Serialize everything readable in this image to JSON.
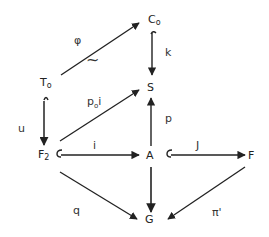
{
  "diagram": {
    "type": "commutative-diagram",
    "nodes": {
      "C0": {
        "base": "C",
        "sub": "o"
      },
      "T0": {
        "base": "T",
        "sub": "o"
      },
      "S": {
        "base": "S",
        "sub": ""
      },
      "F2": {
        "base": "F",
        "sub": "2"
      },
      "A": {
        "base": "A",
        "sub": ""
      },
      "F": {
        "base": "F",
        "sub": ""
      },
      "G": {
        "base": "G",
        "sub": ""
      }
    },
    "arrows": [
      {
        "from": "T0",
        "to": "C0",
        "label": "φ",
        "annotation": "~",
        "style": "iso"
      },
      {
        "from": "C0",
        "to": "S",
        "label": "k",
        "style": "hook-injection"
      },
      {
        "from": "T0",
        "to": "F2",
        "label": "u",
        "style": "hook-injection"
      },
      {
        "from": "F2",
        "to": "S",
        "label": "p₀i",
        "style": "normal"
      },
      {
        "from": "F2",
        "to": "A",
        "label": "i",
        "style": "hook-injection"
      },
      {
        "from": "A",
        "to": "S",
        "label": "p",
        "style": "normal"
      },
      {
        "from": "A",
        "to": "F",
        "label": "J",
        "style": "hook-injection"
      },
      {
        "from": "F2",
        "to": "G",
        "label": "q",
        "style": "normal"
      },
      {
        "from": "A",
        "to": "G",
        "label": "",
        "style": "normal"
      },
      {
        "from": "F",
        "to": "G",
        "label": "π'",
        "style": "normal"
      }
    ],
    "labels": {
      "phi": "φ",
      "tilde": "~",
      "k": "k",
      "u": "u",
      "p0i_p": "p",
      "p0i_sub": "o",
      "p0i_i": "i",
      "i": "i",
      "p": "p",
      "J": "J",
      "q": "q",
      "pi_prime": "π'"
    },
    "colors": {
      "ink": "#222222",
      "background": "#ffffff"
    }
  }
}
